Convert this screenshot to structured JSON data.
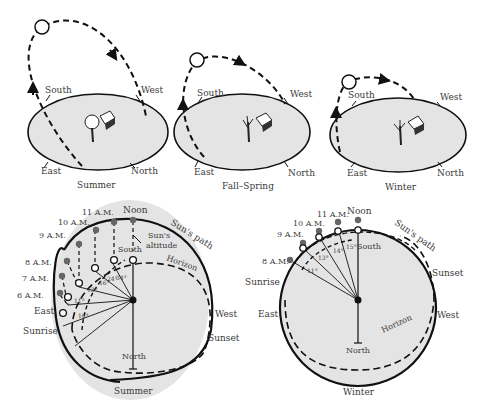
{
  "colors": {
    "ground_fill": "#e4e4e4",
    "stroke": "#111111",
    "sun_marker_filled": "#666666",
    "text": "#3a3a3a"
  },
  "top_panels": [
    {
      "caption": "Summer",
      "directions": {
        "south": "South",
        "west": "West",
        "east": "East",
        "north": "North"
      }
    },
    {
      "caption": "Fall–Spring",
      "directions": {
        "south": "South",
        "west": "West",
        "east": "East",
        "north": "North"
      }
    },
    {
      "caption": "Winter",
      "directions": {
        "south": "South",
        "west": "West",
        "east": "East",
        "north": "North"
      }
    }
  ],
  "summer_sky": {
    "caption": "Summer",
    "labels": {
      "noon": "Noon",
      "suns_path": "Sun's path",
      "suns_altitude_1": "Sun's",
      "suns_altitude_2": "altitude",
      "south": "South",
      "horizon": "Horizon",
      "west": "West",
      "sunset": "Sunset",
      "north": "North",
      "east": "East",
      "sunrise": "Sunrise"
    },
    "hours": [
      "6 A.M.",
      "7 A.M.",
      "8 A.M.",
      "9 A.M.",
      "10 A.M.",
      "11 A.M."
    ],
    "azimuth_angles": [
      "10°",
      "11°",
      "13°",
      "16°",
      "24°",
      "34°"
    ]
  },
  "winter_sky": {
    "caption": "Winter",
    "labels": {
      "noon": "Noon",
      "suns_path": "Sun's path",
      "south": "South",
      "horizon": "Horizon",
      "west": "West",
      "sunset": "Sunset",
      "north": "North",
      "east": "East",
      "sunrise": "Sunrise"
    },
    "hours": [
      "8 A.M.",
      "9 A.M.",
      "10 A.M.",
      "11 A.M."
    ],
    "azimuth_angles": [
      "11°",
      "13°",
      "14°",
      "15°"
    ]
  }
}
